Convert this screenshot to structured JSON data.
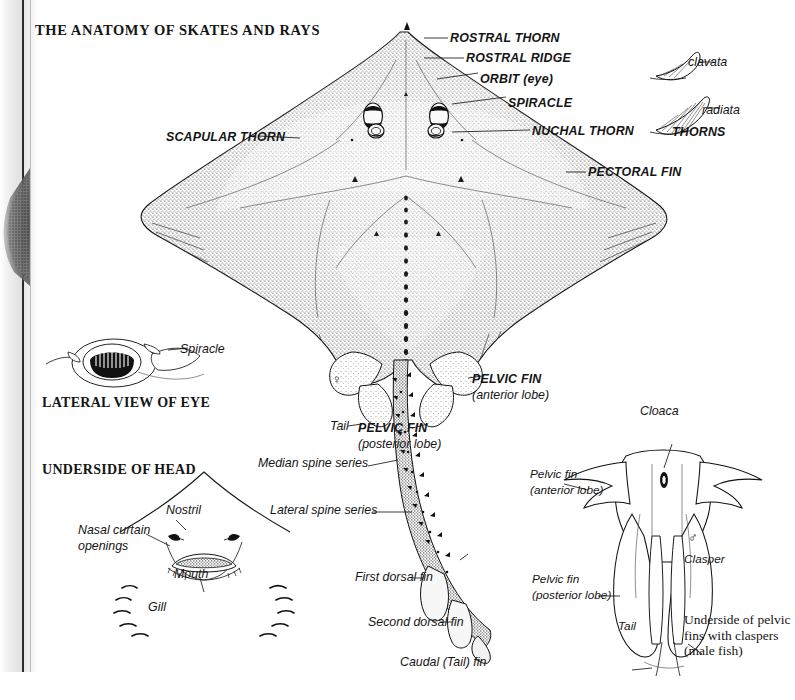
{
  "page": {
    "title": "THE ANATOMY OF SKATES AND RAYS",
    "background_color": "#ffffff",
    "ink_color": "#151515",
    "width": 777,
    "height": 700
  },
  "section_headers": {
    "lateral_eye": "LATERAL VIEW OF EYE",
    "underside_head": "UNDERSIDE OF HEAD"
  },
  "dorsal_view_labels": {
    "rostral_thorn": "ROSTRAL THORN",
    "rostral_ridge": "ROSTRAL RIDGE",
    "orbit": "ORBIT (eye)",
    "spiracle": "SPIRACLE",
    "nuchal_thorn": "NUCHAL THORN",
    "scapular_thorn": "SCAPULAR THORN",
    "pectoral_fin": "PECTORAL FIN",
    "pelvic_fin_anterior": "PELVIC FIN",
    "pelvic_fin_anterior_sub": "(anterior lobe)",
    "pelvic_fin_posterior": "PELVIC FIN",
    "pelvic_fin_posterior_sub": "(posterior lobe)",
    "tail": "Tail",
    "median_spine_series": "Median spine series",
    "lateral_spine_series": "Lateral spine series",
    "first_dorsal_fin": "First dorsal fin",
    "second_dorsal_fin": "Second dorsal fin",
    "caudal_fin": "Caudal (Tail) fin",
    "female_symbol": "♀"
  },
  "thorns_inset": {
    "heading": "THORNS",
    "species": [
      "clavata",
      "radiata"
    ]
  },
  "eye_inset": {
    "spiracle_label": "Spiracle"
  },
  "underside_head_labels": {
    "nostril": "Nostril",
    "nasal_curtain": "Nasal curtain",
    "nasal_curtain_2": "openings",
    "mouth": "Mouth",
    "gill": "Gill"
  },
  "clasper_inset": {
    "cloaca": "Cloaca",
    "pelvic_fin_anterior": "Pelvic fin",
    "pelvic_fin_anterior_sub": "(anterior lobe)",
    "pelvic_fin_posterior": "Pelvic fin",
    "pelvic_fin_posterior_sub": "(posterior lobe)",
    "tail": "Tail",
    "clasper": "Clasper",
    "male_symbol": "♂",
    "caption": "Underside of pelvic fins with claspers (male fish)"
  }
}
